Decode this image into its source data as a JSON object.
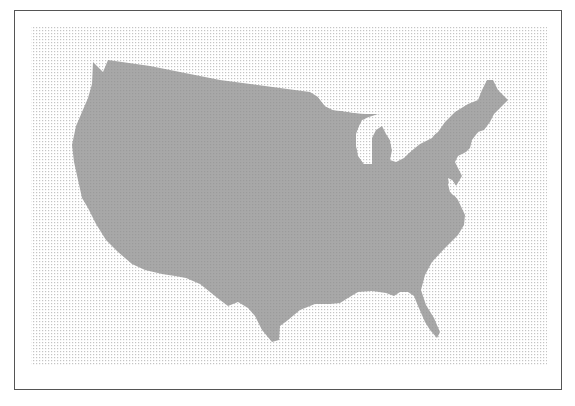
{
  "map": {
    "title": "",
    "subject": "Contiguous United States outline",
    "colors": {
      "frame_border": "#555555",
      "background": "#ffffff",
      "dot_pattern": "#c8c8c8",
      "land_fill": "#a6a6a6",
      "land_dot": "#9a9a9a"
    },
    "regions": [
      {
        "name": "contiguous-us",
        "label": ""
      }
    ]
  }
}
